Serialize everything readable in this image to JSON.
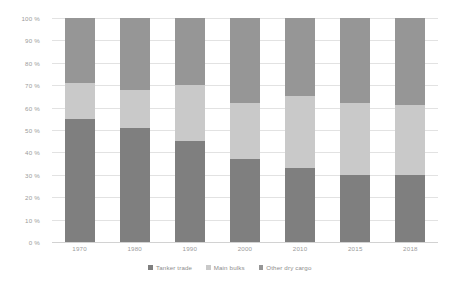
{
  "chart_data": {
    "type": "bar",
    "subtype": "stacked-percent",
    "title": "",
    "xlabel": "",
    "ylabel": "",
    "ylim": [
      0,
      100
    ],
    "grid": true,
    "legend_position": "bottom",
    "categories": [
      "1970",
      "1980",
      "1990",
      "2000",
      "2010",
      "2015",
      "2018"
    ],
    "ytick_labels": [
      "0 %",
      "10 %",
      "20 %",
      "30 %",
      "40 %",
      "50 %",
      "60 %",
      "70 %",
      "80 %",
      "90 %",
      "100 %"
    ],
    "ytick_values": [
      0,
      10,
      20,
      30,
      40,
      50,
      60,
      70,
      80,
      90,
      100
    ],
    "series": [
      {
        "name": "Tanker trade",
        "color": "#7f7f7f",
        "values": [
          55,
          51,
          45,
          37,
          33,
          30,
          30
        ]
      },
      {
        "name": "Main bulks",
        "color": "#c9c9c9",
        "values": [
          16,
          17,
          25,
          25,
          32,
          32,
          31
        ]
      },
      {
        "name": "Other dry cargo",
        "color": "#969696",
        "values": [
          29,
          32,
          30,
          38,
          35,
          38,
          39
        ]
      }
    ]
  },
  "legend": {
    "items": [
      {
        "label": "Tanker trade",
        "color": "#7f7f7f"
      },
      {
        "label": "Main bulks",
        "color": "#c9c9c9"
      },
      {
        "label": "Other dry cargo",
        "color": "#969696"
      }
    ]
  },
  "colors": {
    "background": "#ffffff",
    "gridline": "#e2e2e2",
    "tick_text": "#9b9b9b",
    "legend_text": "#8d8d8d"
  }
}
